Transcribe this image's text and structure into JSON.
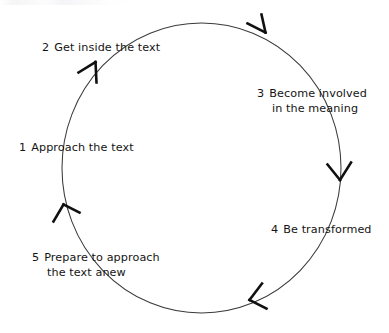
{
  "diagram": {
    "type": "cycle-diagram",
    "direction": "clockwise",
    "stroke_color": "#3a3a3a",
    "arrow_color": "#101010",
    "background_color": "#ffffff",
    "text_color": "#141414",
    "steps": [
      {
        "number": "1",
        "label": "Approach the text",
        "line1": "Approach the text",
        "line2": "",
        "position": "left"
      },
      {
        "number": "2",
        "label": "Get inside the text",
        "line1": "Get inside the text",
        "line2": "",
        "position": "top-left"
      },
      {
        "number": "3",
        "label": "Become involved in the meaning",
        "line1": "Become involved",
        "line2": "in the meaning",
        "position": "right-upper"
      },
      {
        "number": "4",
        "label": "Be transformed",
        "line1": "Be transformed",
        "line2": "",
        "position": "right-lower"
      },
      {
        "number": "5",
        "label": "Prepare to approach the text anew",
        "line1": "Prepare to approach",
        "line2": "the text anew",
        "position": "bottom-left"
      }
    ],
    "arrowheads": [
      {
        "name": "arrowhead-top-right",
        "angle_deg": 300
      },
      {
        "name": "arrowhead-right",
        "angle_deg": 5
      },
      {
        "name": "arrowhead-bottom",
        "angle_deg": 65
      },
      {
        "name": "arrowhead-left-lower",
        "angle_deg": 160
      },
      {
        "name": "arrowhead-left-upper",
        "angle_deg": 226
      }
    ]
  }
}
